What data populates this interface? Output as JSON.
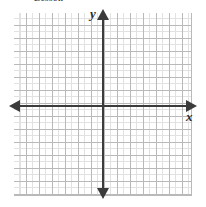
{
  "figure": {
    "kind": "blank-cartesian-coordinate-grid",
    "width": 206,
    "height": 207,
    "header_fragment": "Lesson",
    "background_color": "#ffffff"
  },
  "grid": {
    "major_line_color": "#b9b9b9",
    "minor_line_color": "#e2e2e2",
    "major_spacing_px": 13,
    "minor_spacing_px": 6.5,
    "left_px": 14,
    "top_px": 13,
    "width_px": 178,
    "height_px": 183,
    "major_columns": 14,
    "major_rows": 14
  },
  "axes": {
    "color": "#3b3b3b",
    "origin_x_px": 103,
    "origin_y_px": 106,
    "x_label": "x",
    "y_label": "y",
    "x_arrow_left": "left-arrowhead",
    "x_arrow_right": "right-arrowhead",
    "y_arrow_up": "up-arrowhead",
    "y_arrow_down": "down-arrowhead",
    "tick_labels": [],
    "numbers_shown": false
  },
  "chart_data": {
    "type": "scatter",
    "title": "",
    "subtitle": "",
    "xlabel": "x",
    "ylabel": "y",
    "x": [],
    "y": [],
    "series": [],
    "annotations": [],
    "legend": [],
    "legend_position": "none",
    "grid": true,
    "xlim": [
      -7,
      7
    ],
    "ylim": [
      -7,
      7
    ],
    "xticks": [],
    "yticks": [],
    "note": "Empty coordinate plane — no data points, curves, or tick numbers are drawn."
  }
}
